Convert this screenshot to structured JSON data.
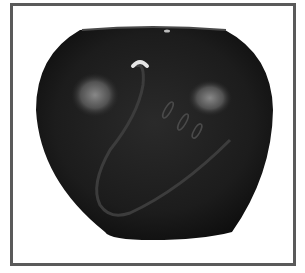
{
  "image": {
    "subject": "black pottery vase",
    "alt": "Polished black pottery jar with carved avanyu serpent design",
    "colors": {
      "frame": "#5a5a5a",
      "background": "#ffffff",
      "vase_body": "#1c1c1c",
      "highlight": "#8a8a8a"
    }
  }
}
